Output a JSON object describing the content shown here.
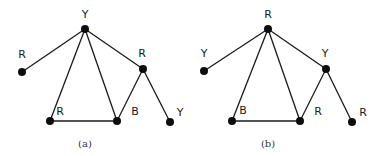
{
  "figure": {
    "graphs": [
      {
        "id": "a",
        "caption": "(a)",
        "caption_pos": [
          85,
          147
        ],
        "nodes": [
          {
            "id": "top",
            "color": "Y",
            "x": 85,
            "y": 29,
            "lx": 85,
            "ly": 18
          },
          {
            "id": "left",
            "color": "R",
            "x": 22,
            "y": 72,
            "lx": 22,
            "ly": 58
          },
          {
            "id": "right",
            "color": "R",
            "x": 143,
            "y": 69,
            "lx": 142,
            "ly": 57
          },
          {
            "id": "bottom-left",
            "color": "R",
            "x": 50,
            "y": 121,
            "lx": 60,
            "ly": 115
          },
          {
            "id": "bottom-middle",
            "color": "B",
            "x": 117,
            "y": 121,
            "lx": 135,
            "ly": 115
          },
          {
            "id": "leaf-right",
            "color": "Y",
            "x": 170,
            "y": 122,
            "lx": 180,
            "ly": 116
          }
        ],
        "edges": [
          [
            "top",
            "left"
          ],
          [
            "top",
            "bottom-left"
          ],
          [
            "top",
            "bottom-middle"
          ],
          [
            "top",
            "right"
          ],
          [
            "bottom-left",
            "bottom-middle"
          ],
          [
            "bottom-middle",
            "right"
          ],
          [
            "right",
            "leaf-right"
          ]
        ]
      },
      {
        "id": "b",
        "caption": "(b)",
        "caption_pos": [
          268,
          147
        ],
        "nodes": [
          {
            "id": "top",
            "color": "R",
            "x": 268,
            "y": 29,
            "lx": 268,
            "ly": 18
          },
          {
            "id": "left",
            "color": "Y",
            "x": 204,
            "y": 71,
            "lx": 204,
            "ly": 57
          },
          {
            "id": "right",
            "color": "Y",
            "x": 326,
            "y": 69,
            "lx": 325,
            "ly": 57
          },
          {
            "id": "bottom-left",
            "color": "B",
            "x": 232,
            "y": 121,
            "lx": 243,
            "ly": 114
          },
          {
            "id": "bottom-middle",
            "color": "R",
            "x": 300,
            "y": 121,
            "lx": 318,
            "ly": 115
          },
          {
            "id": "leaf-right",
            "color": "R",
            "x": 352,
            "y": 122,
            "lx": 363,
            "ly": 116
          }
        ],
        "edges": [
          [
            "top",
            "left"
          ],
          [
            "top",
            "bottom-left"
          ],
          [
            "top",
            "bottom-middle"
          ],
          [
            "top",
            "right"
          ],
          [
            "bottom-left",
            "bottom-middle"
          ],
          [
            "bottom-middle",
            "right"
          ],
          [
            "right",
            "leaf-right"
          ]
        ]
      }
    ]
  }
}
